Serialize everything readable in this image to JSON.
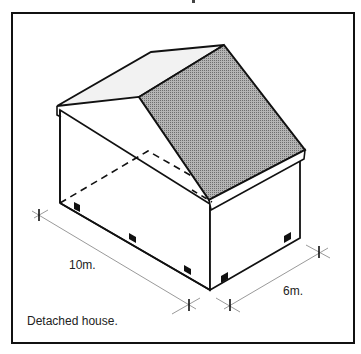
{
  "figure": {
    "caption": "Detached house.",
    "dimensions": {
      "length_label": "10m.",
      "width_label": "6m."
    },
    "colors": {
      "frame": "#111111",
      "outline": "#111111",
      "roof_shaded": "#8f8f8f",
      "roof_light": "#f2f2f2",
      "dimension_line": "#9a9a9a",
      "hidden_line": "#111111",
      "window": "#111111"
    },
    "windows_count": 5
  }
}
